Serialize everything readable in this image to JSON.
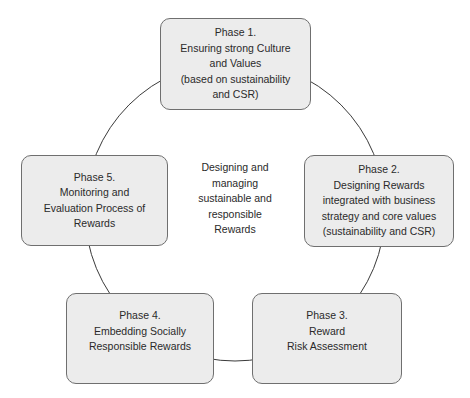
{
  "diagram": {
    "type": "cycle",
    "center_label": [
      "Designing and",
      "managing",
      "sustainable and",
      "responsible",
      "Rewards"
    ],
    "phases": [
      {
        "id": "phase-1",
        "lines": [
          "Phase 1.",
          "Ensuring strong Culture",
          "and Values",
          "(based on sustainability",
          "and CSR)"
        ]
      },
      {
        "id": "phase-2",
        "lines": [
          "Phase 2.",
          "Designing Rewards",
          "integrated with business",
          "strategy and core values",
          "(sustainability and CSR)"
        ]
      },
      {
        "id": "phase-3",
        "lines": [
          "Phase 3.",
          "Reward",
          "Risk Assessment"
        ]
      },
      {
        "id": "phase-4",
        "lines": [
          "Phase 4.",
          "Embedding Socially",
          "Responsible Rewards"
        ]
      },
      {
        "id": "phase-5",
        "lines": [
          "Phase 5.",
          "Monitoring and",
          "Evaluation Process of",
          "Rewards"
        ]
      }
    ],
    "colors": {
      "box_fill": "#ececec",
      "box_border": "#6f6f6f",
      "ring": "#3a3a3a"
    }
  }
}
